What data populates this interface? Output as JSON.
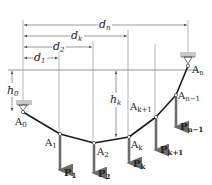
{
  "diagram": {
    "type": "cable-with-concentrated-loads",
    "colors": {
      "cable": "#1a1a1a",
      "dimension_line": "#555555",
      "reference_line": "#555555",
      "load_arrow": "#6b6b6b",
      "support_bar": "#c8c8c8"
    },
    "dimensions": [
      {
        "id": "d1",
        "symbol": "d",
        "sub": "1"
      },
      {
        "id": "d2",
        "symbol": "d",
        "sub": "2"
      },
      {
        "id": "dk",
        "symbol": "d",
        "sub": "k"
      },
      {
        "id": "dn",
        "symbol": "d",
        "sub": "n"
      }
    ],
    "heights": [
      {
        "id": "h0",
        "symbol": "h",
        "sub": "0"
      },
      {
        "id": "hk",
        "symbol": "h",
        "sub": "k"
      }
    ],
    "points": [
      {
        "id": "A0",
        "symbol": "A",
        "sub": "0"
      },
      {
        "id": "A1",
        "symbol": "A",
        "sub": "1"
      },
      {
        "id": "A2",
        "symbol": "A",
        "sub": "2"
      },
      {
        "id": "Ak",
        "symbol": "A",
        "sub": "k"
      },
      {
        "id": "Ak1",
        "symbol": "A",
        "sub": "k+1"
      },
      {
        "id": "An1",
        "symbol": "A",
        "sub": "n−1"
      },
      {
        "id": "An",
        "symbol": "A",
        "sub": "n"
      }
    ],
    "loads": [
      {
        "id": "P1",
        "symbol": "P",
        "sub": "1"
      },
      {
        "id": "P2",
        "symbol": "P",
        "sub": "2"
      },
      {
        "id": "Pk",
        "symbol": "P",
        "sub": "k"
      },
      {
        "id": "Pk1",
        "symbol": "P",
        "sub": "k+1"
      },
      {
        "id": "Pn1",
        "symbol": "P",
        "sub": "n−1"
      }
    ]
  }
}
